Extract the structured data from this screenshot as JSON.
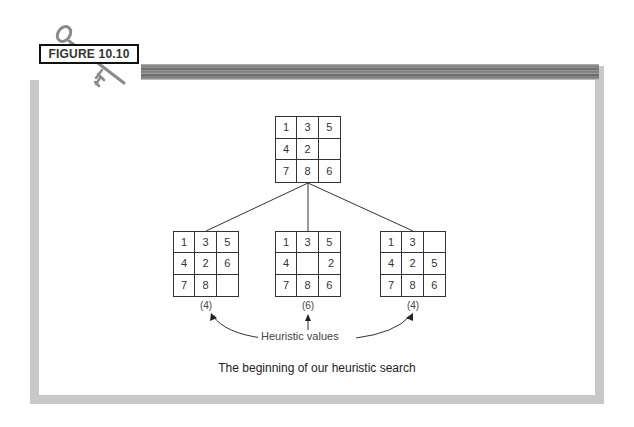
{
  "figure": {
    "label": "FIGURE 10.10",
    "caption": "The beginning of our heuristic search"
  },
  "icons": {
    "figure_icon": "key-icon"
  },
  "colors": {
    "frame": "#c8c8c8",
    "topbar": "#7a7a7a",
    "lines": "#333333"
  },
  "tree": {
    "root": {
      "cells": [
        "1",
        "3",
        "5",
        "4",
        "2",
        "",
        "7",
        "8",
        "6"
      ]
    },
    "children": [
      {
        "cells": [
          "1",
          "3",
          "5",
          "4",
          "2",
          "6",
          "7",
          "8",
          ""
        ],
        "heuristic": "(4)"
      },
      {
        "cells": [
          "1",
          "3",
          "5",
          "4",
          "",
          "2",
          "7",
          "8",
          "6"
        ],
        "heuristic": "(6)"
      },
      {
        "cells": [
          "1",
          "3",
          "",
          "4",
          "2",
          "5",
          "7",
          "8",
          "6"
        ],
        "heuristic": "(4)"
      }
    ],
    "heuristic_label": "Heuristic values"
  }
}
